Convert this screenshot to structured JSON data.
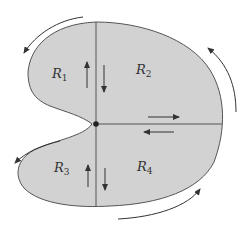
{
  "figure": {
    "colors": {
      "fill": "#d2d2d2",
      "stroke": "#555555",
      "arrow": "#333333",
      "background": "#ffffff"
    },
    "regions": [
      {
        "id": "R1",
        "letter": "R",
        "sub": "1"
      },
      {
        "id": "R2",
        "letter": "R",
        "sub": "2"
      },
      {
        "id": "R3",
        "letter": "R",
        "sub": "3"
      },
      {
        "id": "R4",
        "letter": "R",
        "sub": "4"
      }
    ],
    "interior_arrows": [
      {
        "location": "vertical cut upper, left side",
        "direction": "up"
      },
      {
        "location": "vertical cut upper, right side",
        "direction": "down"
      },
      {
        "location": "horizontal cut, above",
        "direction": "right"
      },
      {
        "location": "horizontal cut, below",
        "direction": "left"
      },
      {
        "location": "vertical cut lower, left side",
        "direction": "up"
      },
      {
        "location": "vertical cut lower, right side",
        "direction": "down"
      }
    ],
    "boundary_arrows": [
      {
        "location": "upper-left",
        "direction": "counterclockwise"
      },
      {
        "location": "right",
        "direction": "counterclockwise"
      },
      {
        "location": "lower-left",
        "direction": "counterclockwise"
      },
      {
        "location": "bottom",
        "direction": "counterclockwise"
      }
    ]
  }
}
